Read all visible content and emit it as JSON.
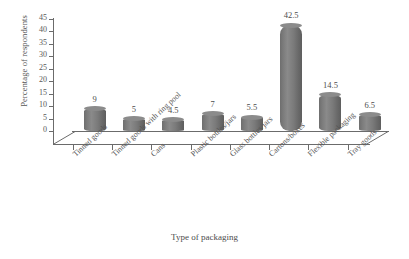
{
  "chart_data": {
    "type": "bar",
    "title": "",
    "xlabel": "Type of packaging",
    "ylabel": "Percentage of respondents",
    "ylim": [
      0,
      45
    ],
    "ytick_step": 5,
    "yticks": [
      45,
      40,
      35,
      30,
      25,
      20,
      15,
      10,
      5,
      0
    ],
    "grid": false,
    "legend": "none",
    "bar_style": "3d-cylinder",
    "bar_color": "#7d7d7d",
    "axis_color": "#6b6b6b",
    "categories": [
      "Tinned goods",
      "Tinned goods with ring pool",
      "Cans",
      "Plastic bottles/jars",
      "Glass bottles/jars",
      "Cartons/boxes",
      "Flexible packaging",
      "Tray goods"
    ],
    "values": [
      9,
      5,
      4.5,
      7,
      5.5,
      42.5,
      14.5,
      6.5
    ],
    "value_labels": [
      "9",
      "5",
      "4.5",
      "7",
      "5.5",
      "42.5",
      "14.5",
      "6.5"
    ]
  }
}
